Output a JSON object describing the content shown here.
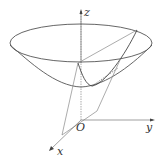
{
  "figure": {
    "type": "3d-paraboloid-diagram",
    "labels": {
      "z_axis": "z",
      "y_axis": "y",
      "x_axis": "x",
      "origin": "O"
    },
    "colors": {
      "stroke": "#555555",
      "light_stroke": "#888888",
      "background": "#ffffff"
    }
  }
}
